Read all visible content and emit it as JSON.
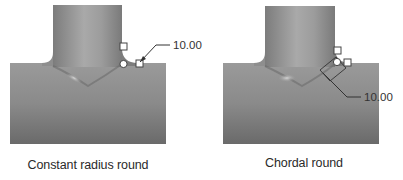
{
  "figures": [
    {
      "id": "constant-radius",
      "caption": "Constant radius round",
      "dimension_value": "10.00"
    },
    {
      "id": "chordal",
      "caption": "Chordal round",
      "dimension_value": "10.00"
    }
  ],
  "colors": {
    "body_dark": "#6e6e6e",
    "body_light": "#a8a8a8",
    "handle_fill": "#ffffff",
    "leader": "#333333"
  }
}
